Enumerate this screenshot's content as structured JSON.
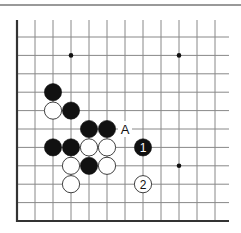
{
  "diagram": {
    "type": "go-board-corner",
    "colors": {
      "background": "#ffffff",
      "line": "#888888",
      "edge": "#333333",
      "black": "#111111",
      "white": "#ffffff",
      "top_rule": "#777777"
    },
    "grid": {
      "x0": 17,
      "dx": 18,
      "cols": 12,
      "y0": 37,
      "dy": 18.4,
      "rows": 11,
      "line_right": 229,
      "line_top": 20
    },
    "star_points": [
      {
        "col": 3,
        "row": 1
      },
      {
        "col": 9,
        "row": 1
      },
      {
        "col": 9,
        "row": 7
      }
    ],
    "stones": [
      {
        "color": "black",
        "col": 2,
        "row": 3
      },
      {
        "color": "white",
        "col": 2,
        "row": 4
      },
      {
        "color": "black",
        "col": 3,
        "row": 4
      },
      {
        "color": "black",
        "col": 4,
        "row": 5
      },
      {
        "color": "black",
        "col": 5,
        "row": 5
      },
      {
        "color": "black",
        "col": 2,
        "row": 6
      },
      {
        "color": "black",
        "col": 3,
        "row": 6
      },
      {
        "color": "white",
        "col": 4,
        "row": 6
      },
      {
        "color": "white",
        "col": 5,
        "row": 6
      },
      {
        "color": "white",
        "col": 3,
        "row": 7
      },
      {
        "color": "black",
        "col": 4,
        "row": 7
      },
      {
        "color": "white",
        "col": 5,
        "row": 7
      },
      {
        "color": "white",
        "col": 3,
        "row": 8
      },
      {
        "color": "black",
        "col": 7,
        "row": 6,
        "label": "1"
      },
      {
        "color": "white",
        "col": 7,
        "row": 8,
        "label": "2"
      }
    ],
    "labels": [
      {
        "text": "A",
        "col": 6,
        "row": 5
      }
    ]
  }
}
